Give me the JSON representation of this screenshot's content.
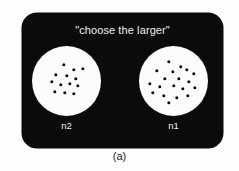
{
  "figure": {
    "caption": "(a)",
    "background_color": "#fdfdfd"
  },
  "panel": {
    "background_color": "#0c0b0b",
    "instruction": "\"choose the larger\""
  },
  "arrays": [
    {
      "id": "left",
      "label": "n2",
      "dot_count": 13,
      "circle_color": "#fcfcfa",
      "dot_color": "#090909",
      "dots": [
        {
          "x": 31.5,
          "y": 19.0
        },
        {
          "x": 42.0,
          "y": 23.5
        },
        {
          "x": 51.0,
          "y": 23.0
        },
        {
          "x": 24.0,
          "y": 28.5
        },
        {
          "x": 34.5,
          "y": 30.0
        },
        {
          "x": 44.0,
          "y": 33.0
        },
        {
          "x": 19.5,
          "y": 36.0
        },
        {
          "x": 29.0,
          "y": 38.5
        },
        {
          "x": 38.0,
          "y": 37.5
        },
        {
          "x": 46.0,
          "y": 40.0
        },
        {
          "x": 23.0,
          "y": 45.5
        },
        {
          "x": 33.0,
          "y": 47.0
        },
        {
          "x": 42.0,
          "y": 47.5
        }
      ]
    },
    {
      "id": "right",
      "label": "n1",
      "dot_count": 19,
      "circle_color": "#fcfcfa",
      "dot_color": "#090909",
      "dots": [
        {
          "x": 30.0,
          "y": 16.0
        },
        {
          "x": 41.5,
          "y": 20.5
        },
        {
          "x": 18.0,
          "y": 24.5
        },
        {
          "x": 33.5,
          "y": 26.0
        },
        {
          "x": 47.5,
          "y": 23.5
        },
        {
          "x": 55.0,
          "y": 28.0
        },
        {
          "x": 26.0,
          "y": 32.5
        },
        {
          "x": 40.0,
          "y": 33.0
        },
        {
          "x": 50.0,
          "y": 35.5
        },
        {
          "x": 10.5,
          "y": 38.0
        },
        {
          "x": 21.0,
          "y": 41.0
        },
        {
          "x": 34.5,
          "y": 40.0
        },
        {
          "x": 44.0,
          "y": 43.0
        },
        {
          "x": 55.5,
          "y": 42.0
        },
        {
          "x": 14.0,
          "y": 47.0
        },
        {
          "x": 25.0,
          "y": 50.0
        },
        {
          "x": 37.5,
          "y": 51.5
        },
        {
          "x": 48.5,
          "y": 50.0
        },
        {
          "x": 30.0,
          "y": 56.5
        }
      ]
    }
  ]
}
